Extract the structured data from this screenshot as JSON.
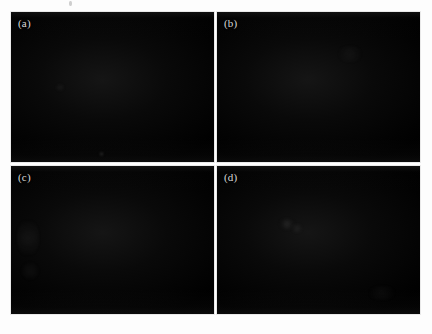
{
  "figure": {
    "type": "multi-panel-image-figure",
    "panel_count": 4,
    "layout": "2x2 grid",
    "background_color": "#fdfdfd",
    "gutter_color": "#ffffff",
    "panel_color": "#050505",
    "label_color": "#d8d8d8",
    "panels": [
      {
        "id": "a",
        "label": "(a)",
        "position": "top-left",
        "appearance": "near-black image field, essentially uniform dark background",
        "features": "one faint small bright speck in the lower-left quadrant, very faint haze upper-left"
      },
      {
        "id": "b",
        "label": "(b)",
        "position": "top-right",
        "appearance": "near-black image field, uniform dark background",
        "features": "very faint broad haze near the upper-centre"
      },
      {
        "id": "c",
        "label": "(c)",
        "position": "bottom-left",
        "appearance": "near-black image field with slightly lighter left edge",
        "features": "two faint diffuse gradient blobs along the left edge"
      },
      {
        "id": "d",
        "label": "(d)",
        "position": "bottom-right",
        "appearance": "near-black image field, uniform dark background",
        "features": "faint small smudge upper-left of centre, faint wide haze lower-centre"
      }
    ]
  }
}
